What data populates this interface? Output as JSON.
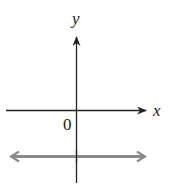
{
  "diagram": {
    "type": "coordinate-plane",
    "axes": {
      "x_label": "x",
      "y_label": "y",
      "origin_label": "0",
      "axis_color": "#222222"
    },
    "line": {
      "description": "horizontal line below the x-axis (y = negative constant)",
      "orientation": "horizontal",
      "position": "below x-axis",
      "arrows": "both ends",
      "color": "#8a8a8a"
    }
  }
}
